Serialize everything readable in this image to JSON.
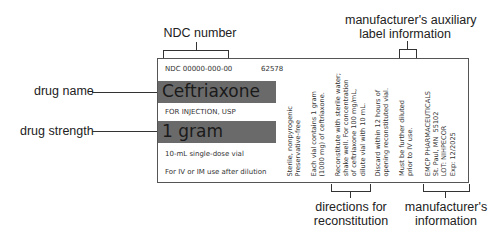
{
  "callouts": {
    "ndc_number": "NDC number",
    "drug_name": "drug name",
    "drug_strength": "drug strength",
    "aux_label_line1": "manufacturer's auxiliary",
    "aux_label_line2": "label information",
    "reconstitution_line1": "directions for",
    "reconstitution_line2": "reconstitution",
    "manufacturer_line1": "manufacturer's",
    "manufacturer_line2": "information"
  },
  "label": {
    "ndc": "NDC 00000-000-00",
    "code": "62578",
    "drug_name": "Ceftriaxone",
    "form": "FOR INJECTION, USP",
    "strength": "1 gram",
    "vial": "10-mL single-dose vial",
    "route": "For IV or IM use after dilution",
    "columns": [
      "Sterile, nonpyrogenic\nPreservative-free",
      "Each vial contains 1 gram\n(1000 mg) of ceftriaxone.",
      "Reconstitute with sterile water;\nshake well. For concentration\nof ceftriaxone 100 mg/mL,\ndilute vial with 10 mL.",
      "Discard within 12 hours of\nopening reconstituted vial.",
      "Must be further diluted\nprior to IV use.",
      "EMCP PHARMACEUTICALS\nSt. Paul, MN  55102\nLOT: NIHPECOR\nExp: 12/2025"
    ]
  },
  "colors": {
    "highlight_bar": "#6a6a6a",
    "border": "#555555",
    "text": "#222222"
  }
}
